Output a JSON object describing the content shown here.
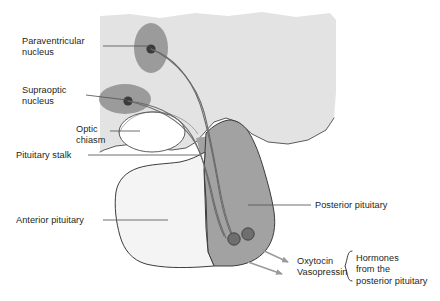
{
  "diagram": {
    "colors": {
      "brain_tissue": "#e3e3e3",
      "posterior_pituitary": "#a2a2a2",
      "anterior_pituitary": "#f4f4f4",
      "nucleus_fill": "#9b9b9b",
      "nucleus_core": "#3a3a3a",
      "terminal_fill": "#6e6e6e",
      "outline": "#3c3c3c",
      "leader_line": "#555555",
      "arrow": "#9a9a9a",
      "text": "#231f20",
      "optic_chiasm_fill": "#ffffff"
    },
    "labels": [
      {
        "id": "paraventricular-nucleus",
        "lines": [
          "Paraventricular",
          "nucleus"
        ],
        "text": "Paraventricular\nnucleus",
        "side": "left",
        "x": 22,
        "y": 36
      },
      {
        "id": "supraoptic-nucleus",
        "lines": [
          "Supraoptic",
          "nucleus"
        ],
        "text": "Supraoptic\nnucleus",
        "side": "left",
        "x": 22,
        "y": 85
      },
      {
        "id": "optic-chiasm",
        "lines": [
          "Optic",
          "chiasm"
        ],
        "text": "Optic\nchiasm",
        "side": "left",
        "x": 76,
        "y": 124
      },
      {
        "id": "pituitary-stalk",
        "lines": [
          "Pituitary stalk"
        ],
        "text": "Pituitary stalk",
        "side": "left",
        "x": 16,
        "y": 150
      },
      {
        "id": "anterior-pituitary",
        "lines": [
          "Anterior pituitary"
        ],
        "text": "Anterior pituitary",
        "side": "left",
        "x": 16,
        "y": 215
      },
      {
        "id": "posterior-pituitary",
        "lines": [
          "Posterior pituitary"
        ],
        "text": "Posterior pituitary",
        "side": "right",
        "x": 315,
        "y": 200
      }
    ],
    "hormones": {
      "items": [
        "Oxytocin",
        "Vasopressin"
      ],
      "text": "Oxytocin\nVasopressin",
      "x": 297,
      "y": 256,
      "bracket_note": {
        "lines": [
          "Hormones",
          "from the",
          "posterior pituitary"
        ],
        "text": "Hormones\nfrom the\nposterior pituitary",
        "x": 356,
        "y": 253
      }
    },
    "structures": [
      {
        "id": "brain-tissue",
        "name": "hypothalamus-brain-tissue"
      },
      {
        "id": "optic-chiasm",
        "name": "optic-chiasm"
      },
      {
        "id": "paraventricular-nucleus",
        "name": "paraventricular-nucleus"
      },
      {
        "id": "supraoptic-nucleus",
        "name": "supraoptic-nucleus"
      },
      {
        "id": "pituitary-stalk",
        "name": "pituitary-stalk"
      },
      {
        "id": "anterior-pituitary",
        "name": "anterior-pituitary"
      },
      {
        "id": "posterior-pituitary",
        "name": "posterior-pituitary"
      },
      {
        "id": "axon-tracts",
        "name": "hypothalamo-hypophyseal-axon-tracts"
      },
      {
        "id": "nerve-terminals",
        "name": "nerve-terminals"
      }
    ]
  }
}
